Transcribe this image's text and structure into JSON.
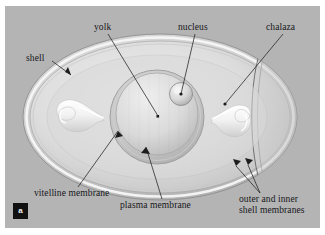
{
  "figure": {
    "panel_letter": "a",
    "background_color": "#b4b4b4",
    "page_color": "#ffffff",
    "label_color": "#16161a",
    "badge_color": "#111111",
    "shell_fill": "#c9c9c9",
    "albumen_fill": "#d8d8d8",
    "yolk_fill": "#dcdcdc",
    "chalaza_fill": "#f4f4f4",
    "highlight_color": "#f6f6f6"
  },
  "labels": {
    "shell": "shell",
    "yolk": "yolk",
    "nucleus": "nucleus",
    "chalaza": "chalaza",
    "vitelline_membrane": "vitelline membrane",
    "plasma_membrane": "plasma membrane",
    "shell_membranes_line1": "outer and inner",
    "shell_membranes_line2": "shell membranes"
  },
  "parts": [
    {
      "name": "shell",
      "label": "shell",
      "side": "left-top"
    },
    {
      "name": "yolk",
      "label": "yolk",
      "side": "top"
    },
    {
      "name": "nucleus",
      "label": "nucleus",
      "side": "top"
    },
    {
      "name": "chalaza",
      "label": "chalaza",
      "side": "right-top"
    },
    {
      "name": "vitelline-membrane",
      "label": "vitelline membrane",
      "side": "bottom-left"
    },
    {
      "name": "plasma-membrane",
      "label": "plasma membrane",
      "side": "bottom"
    },
    {
      "name": "outer-and-inner-shell-membranes",
      "label": "outer and inner shell membranes",
      "side": "bottom-right"
    }
  ]
}
